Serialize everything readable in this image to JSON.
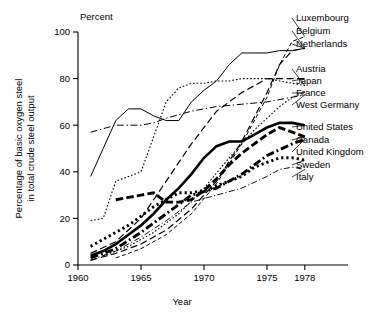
{
  "chart_data": {
    "type": "line",
    "title": "",
    "xlabel": "Year",
    "ylabel": "Percentage of basic oxygen steel\nin total crude steel output",
    "y_unit_label": "Percent",
    "xlim": [
      1960,
      1980
    ],
    "ylim": [
      0,
      100
    ],
    "xticks": [
      1960,
      1965,
      1970,
      1975,
      1978
    ],
    "yticks": [
      0,
      20,
      40,
      60,
      80,
      100
    ],
    "grid": false,
    "legend_position": "right-inline-labels",
    "series": [
      {
        "name": "Luxembourg",
        "style": "dashed",
        "x": [
          1963,
          1965,
          1967,
          1969,
          1971,
          1973,
          1975,
          1976,
          1977,
          1978
        ],
        "values": [
          3,
          7,
          13,
          22,
          35,
          52,
          72,
          86,
          96,
          98
        ]
      },
      {
        "name": "Belgium",
        "style": "dashed-long",
        "x": [
          1961,
          1963,
          1965,
          1967,
          1969,
          1971,
          1973,
          1975,
          1976,
          1977,
          1978
        ],
        "values": [
          2,
          5,
          9,
          15,
          24,
          36,
          53,
          74,
          86,
          92,
          93
        ]
      },
      {
        "name": "Netherlands",
        "style": "solid-thin",
        "x": [
          1961,
          1962,
          1963,
          1964,
          1965,
          1966,
          1967,
          1968,
          1969,
          1970,
          1971,
          1972,
          1973,
          1974,
          1975,
          1976,
          1977,
          1978
        ],
        "values": [
          38,
          50,
          62,
          67,
          67,
          64,
          62,
          62,
          70,
          75,
          79,
          86,
          91,
          91,
          91,
          92,
          92,
          93
        ]
      },
      {
        "name": "Austria",
        "style": "dotted",
        "x": [
          1961,
          1962,
          1963,
          1964,
          1965,
          1966,
          1967,
          1968,
          1969,
          1970,
          1971,
          1972,
          1973,
          1974,
          1975,
          1976,
          1977,
          1978
        ],
        "values": [
          19,
          20,
          36,
          38,
          40,
          55,
          70,
          76,
          78,
          78,
          79,
          79,
          80,
          80,
          80,
          79,
          78,
          77
        ]
      },
      {
        "name": "Japan",
        "style": "dashed-long",
        "x": [
          1961,
          1963,
          1965,
          1967,
          1969,
          1971,
          1973,
          1975,
          1977,
          1978
        ],
        "values": [
          5,
          10,
          20,
          36,
          52,
          66,
          74,
          80,
          80,
          80
        ]
      },
      {
        "name": "France",
        "style": "dotted",
        "x": [
          1962,
          1964,
          1966,
          1968,
          1970,
          1972,
          1974,
          1975,
          1976,
          1977,
          1978
        ],
        "values": [
          4,
          8,
          14,
          22,
          33,
          46,
          58,
          63,
          68,
          72,
          74
        ]
      },
      {
        "name": "West Germany",
        "style": "dash-dot",
        "x": [
          1961,
          1963,
          1965,
          1966,
          1967,
          1969,
          1971,
          1973,
          1975,
          1977,
          1978
        ],
        "values": [
          57,
          60,
          60,
          61,
          63,
          66,
          68,
          69,
          70,
          72,
          73
        ]
      },
      {
        "name": "United States",
        "style": "solid-thick",
        "x": [
          1961,
          1962,
          1963,
          1964,
          1965,
          1966,
          1967,
          1968,
          1969,
          1970,
          1971,
          1972,
          1973,
          1974,
          1975,
          1976,
          1977,
          1978
        ],
        "values": [
          4,
          6,
          9,
          13,
          17,
          22,
          28,
          33,
          39,
          46,
          51,
          53,
          53,
          56,
          59,
          61,
          61,
          60
        ]
      },
      {
        "name": "Canada",
        "style": "dashed-thick",
        "x": [
          1963,
          1964,
          1965,
          1966,
          1967,
          1968,
          1969,
          1970,
          1971,
          1972,
          1973,
          1974,
          1975,
          1976,
          1977,
          1978
        ],
        "values": [
          28,
          29,
          30,
          31,
          27,
          27,
          28,
          32,
          37,
          43,
          48,
          52,
          56,
          59,
          57,
          55
        ]
      },
      {
        "name": "United Kingdom",
        "style": "dash-dot-thick",
        "x": [
          1961,
          1963,
          1965,
          1967,
          1969,
          1971,
          1973,
          1975,
          1977,
          1978
        ],
        "values": [
          3,
          7,
          14,
          22,
          30,
          33,
          39,
          47,
          52,
          54
        ]
      },
      {
        "name": "Sweden",
        "style": "dotted-thick",
        "x": [
          1961,
          1962,
          1963,
          1964,
          1965,
          1966,
          1967,
          1968,
          1969,
          1970,
          1971,
          1972,
          1973,
          1974,
          1975,
          1976,
          1977,
          1978
        ],
        "values": [
          8,
          11,
          14,
          17,
          21,
          25,
          28,
          31,
          31,
          32,
          34,
          36,
          38,
          42,
          44,
          46,
          46,
          45
        ]
      },
      {
        "name": "Italy",
        "style": "dash-dot-thin",
        "x": [
          1961,
          1963,
          1965,
          1967,
          1969,
          1971,
          1973,
          1975,
          1976,
          1977,
          1978
        ],
        "values": [
          2,
          6,
          12,
          19,
          27,
          30,
          33,
          38,
          41,
          42,
          41
        ]
      }
    ],
    "series_labels_right": [
      {
        "name": "Luxembourg",
        "label_y_px": 18
      },
      {
        "name": "Belgium",
        "label_y_px": 31
      },
      {
        "name": "Netherlands",
        "label_y_px": 44
      },
      {
        "name": "Austria",
        "label_y_px": 69
      },
      {
        "name": "Japan",
        "label_y_px": 81
      },
      {
        "name": "France",
        "label_y_px": 93
      },
      {
        "name": "West Germany",
        "label_y_px": 105
      },
      {
        "name": "United States",
        "label_y_px": 127
      },
      {
        "name": "Canada",
        "label_y_px": 140
      },
      {
        "name": "United Kingdom",
        "label_y_px": 152
      },
      {
        "name": "Sweden",
        "label_y_px": 165
      },
      {
        "name": "Italy",
        "label_y_px": 177
      }
    ]
  }
}
